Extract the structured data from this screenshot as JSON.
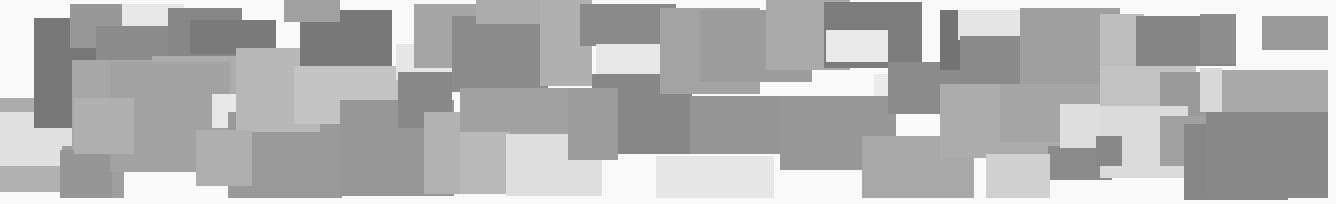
{
  "image": {
    "title": "Abstract grayscale rectangle mosaic",
    "description": "A horizontal band composed of many overlapping flat-gray rectangles of varying tone and size, forming a ragged collage against a white background.",
    "width": 1336,
    "height": 204,
    "background_color": "#ffffff",
    "style": "scanned halftone print texture",
    "palette": {
      "darkest": "#6f6f6f",
      "dark": "#7c7c7c",
      "mid_dark": "#8d8d8d",
      "mid": "#9a9a9a",
      "mid_light": "#a8a8a8",
      "light": "#b8b8b8",
      "lighter": "#c9c9c9",
      "pale": "#dcdcdc",
      "palest": "#eaeaea",
      "near_white": "#f2f2f2"
    },
    "tile_count": 52,
    "tiles": [
      {
        "name": "tile-01",
        "x": 0,
        "y": 98,
        "w": 96,
        "h": 30,
        "color": "#b0b0b0"
      },
      {
        "name": "tile-02",
        "x": 0,
        "y": 112,
        "w": 120,
        "h": 60,
        "color": "#e6e6e6"
      },
      {
        "name": "tile-03",
        "x": 0,
        "y": 166,
        "w": 120,
        "h": 26,
        "color": "#b5b5b5"
      },
      {
        "name": "tile-04",
        "x": 62,
        "y": 146,
        "w": 62,
        "h": 52,
        "color": "#a2a2a2"
      },
      {
        "name": "tile-05",
        "x": 34,
        "y": 18,
        "w": 66,
        "h": 110,
        "color": "#7a7a7a"
      },
      {
        "name": "tile-06",
        "x": 70,
        "y": 4,
        "w": 58,
        "h": 44,
        "color": "#9b9b9b"
      },
      {
        "name": "tile-07",
        "x": 122,
        "y": 4,
        "w": 62,
        "h": 36,
        "color": "#eeeeee"
      },
      {
        "name": "tile-08",
        "x": 96,
        "y": 26,
        "w": 84,
        "h": 48,
        "color": "#8f8f8f"
      },
      {
        "name": "tile-09",
        "x": 72,
        "y": 60,
        "w": 96,
        "h": 96,
        "color": "#ababab"
      },
      {
        "name": "tile-10",
        "x": 60,
        "y": 150,
        "w": 52,
        "h": 48,
        "color": "#999999"
      },
      {
        "name": "tile-11",
        "x": 168,
        "y": 8,
        "w": 74,
        "h": 58,
        "color": "#8a8a8a"
      },
      {
        "name": "tile-12",
        "x": 152,
        "y": 56,
        "w": 84,
        "h": 74,
        "color": "#b0b0b0"
      },
      {
        "name": "tile-13",
        "x": 110,
        "y": 62,
        "w": 120,
        "h": 110,
        "color": "#a6a6a6"
      },
      {
        "name": "tile-14",
        "x": 74,
        "y": 98,
        "w": 60,
        "h": 56,
        "color": "#b4b4b4"
      },
      {
        "name": "tile-15",
        "x": 212,
        "y": 94,
        "w": 62,
        "h": 34,
        "color": "#ededed"
      },
      {
        "name": "tile-16",
        "x": 228,
        "y": 112,
        "w": 114,
        "h": 86,
        "color": "#9d9d9d"
      },
      {
        "name": "tile-17",
        "x": 190,
        "y": 20,
        "w": 86,
        "h": 34,
        "color": "#7d7d7d"
      },
      {
        "name": "tile-18",
        "x": 236,
        "y": 48,
        "w": 84,
        "h": 84,
        "color": "#bcbcbc"
      },
      {
        "name": "tile-19",
        "x": 196,
        "y": 130,
        "w": 56,
        "h": 56,
        "color": "#b3b3b3"
      },
      {
        "name": "tile-20",
        "x": 300,
        "y": 10,
        "w": 92,
        "h": 62,
        "color": "#7b7b7b"
      },
      {
        "name": "tile-21",
        "x": 284,
        "y": 0,
        "w": 56,
        "h": 22,
        "color": "#a4a4a4"
      },
      {
        "name": "tile-22",
        "x": 294,
        "y": 66,
        "w": 110,
        "h": 58,
        "color": "#c8c8c8"
      },
      {
        "name": "tile-23",
        "x": 340,
        "y": 100,
        "w": 114,
        "h": 96,
        "color": "#9a9a9a"
      },
      {
        "name": "tile-24",
        "x": 396,
        "y": 44,
        "w": 62,
        "h": 36,
        "color": "#ececec"
      },
      {
        "name": "tile-25",
        "x": 414,
        "y": 4,
        "w": 94,
        "h": 64,
        "color": "#a9a9a9"
      },
      {
        "name": "tile-26",
        "x": 398,
        "y": 72,
        "w": 54,
        "h": 56,
        "color": "#8c8c8c"
      },
      {
        "name": "tile-27",
        "x": 424,
        "y": 112,
        "w": 62,
        "h": 82,
        "color": "#b6b6b6"
      },
      {
        "name": "tile-28",
        "x": 452,
        "y": 16,
        "w": 96,
        "h": 76,
        "color": "#8f8f8f"
      },
      {
        "name": "tile-29",
        "x": 476,
        "y": 0,
        "w": 82,
        "h": 24,
        "color": "#b0b0b0"
      },
      {
        "name": "tile-30",
        "x": 460,
        "y": 88,
        "w": 122,
        "h": 50,
        "color": "#a5a5a5"
      },
      {
        "name": "tile-31",
        "x": 460,
        "y": 132,
        "w": 50,
        "h": 62,
        "color": "#bdbdbd"
      },
      {
        "name": "tile-32",
        "x": 506,
        "y": 134,
        "w": 96,
        "h": 62,
        "color": "#e4e4e4"
      },
      {
        "name": "tile-33",
        "x": 540,
        "y": 0,
        "w": 52,
        "h": 86,
        "color": "#b4b4b4"
      },
      {
        "name": "tile-34",
        "x": 580,
        "y": 4,
        "w": 96,
        "h": 42,
        "color": "#8d8d8d"
      },
      {
        "name": "tile-35",
        "x": 596,
        "y": 44,
        "w": 66,
        "h": 38,
        "color": "#ededed"
      },
      {
        "name": "tile-36",
        "x": 592,
        "y": 74,
        "w": 100,
        "h": 80,
        "color": "#8a8a8a"
      },
      {
        "name": "tile-37",
        "x": 568,
        "y": 88,
        "w": 50,
        "h": 72,
        "color": "#a0a0a0"
      },
      {
        "name": "tile-38",
        "x": 660,
        "y": 8,
        "w": 100,
        "h": 86,
        "color": "#a7a7a7"
      },
      {
        "name": "tile-39",
        "x": 700,
        "y": 10,
        "w": 112,
        "h": 72,
        "color": "#a0a0a0"
      },
      {
        "name": "tile-40",
        "x": 656,
        "y": 156,
        "w": 118,
        "h": 42,
        "color": "#ececec"
      },
      {
        "name": "tile-41",
        "x": 690,
        "y": 96,
        "w": 112,
        "h": 58,
        "color": "#999999"
      },
      {
        "name": "tile-42",
        "x": 766,
        "y": 0,
        "w": 84,
        "h": 70,
        "color": "#aeaeae"
      },
      {
        "name": "tile-43",
        "x": 824,
        "y": 2,
        "w": 98,
        "h": 66,
        "color": "#7f7f7f"
      },
      {
        "name": "tile-44",
        "x": 826,
        "y": 30,
        "w": 62,
        "h": 32,
        "color": "#efefef"
      },
      {
        "name": "tile-45",
        "x": 874,
        "y": 74,
        "w": 34,
        "h": 34,
        "color": "#f1f1f1"
      },
      {
        "name": "tile-46",
        "x": 780,
        "y": 96,
        "w": 116,
        "h": 74,
        "color": "#9b9b9b"
      },
      {
        "name": "tile-47",
        "x": 888,
        "y": 62,
        "w": 74,
        "h": 52,
        "color": "#8e8e8e"
      },
      {
        "name": "tile-48",
        "x": 862,
        "y": 136,
        "w": 112,
        "h": 62,
        "color": "#acacac"
      },
      {
        "name": "tile-49",
        "x": 940,
        "y": 10,
        "w": 26,
        "h": 60,
        "color": "#767676"
      },
      {
        "name": "tile-50",
        "x": 958,
        "y": 10,
        "w": 64,
        "h": 30,
        "color": "#ebebeb"
      },
      {
        "name": "tile-51",
        "x": 960,
        "y": 36,
        "w": 64,
        "h": 48,
        "color": "#8d8d8d"
      },
      {
        "name": "tile-52",
        "x": 1020,
        "y": 8,
        "w": 100,
        "h": 82,
        "color": "#a3a3a3"
      },
      {
        "name": "tile-53",
        "x": 940,
        "y": 84,
        "w": 120,
        "h": 74,
        "color": "#b0b0b0"
      },
      {
        "name": "tile-54",
        "x": 1000,
        "y": 84,
        "w": 116,
        "h": 58,
        "color": "#a9a9a9"
      },
      {
        "name": "tile-55",
        "x": 1048,
        "y": 146,
        "w": 64,
        "h": 34,
        "color": "#8e8e8e"
      },
      {
        "name": "tile-56",
        "x": 986,
        "y": 154,
        "w": 64,
        "h": 44,
        "color": "#d5d5d5"
      },
      {
        "name": "tile-57",
        "x": 1060,
        "y": 104,
        "w": 60,
        "h": 44,
        "color": "#e4e4e4"
      },
      {
        "name": "tile-58",
        "x": 1100,
        "y": 14,
        "w": 44,
        "h": 52,
        "color": "#c2c2c2"
      },
      {
        "name": "tile-59",
        "x": 1136,
        "y": 16,
        "w": 100,
        "h": 50,
        "color": "#888888"
      },
      {
        "name": "tile-60",
        "x": 1100,
        "y": 66,
        "w": 96,
        "h": 42,
        "color": "#c7c7c7"
      },
      {
        "name": "tile-61",
        "x": 1160,
        "y": 72,
        "w": 62,
        "h": 56,
        "color": "#9e9e9e"
      },
      {
        "name": "tile-62",
        "x": 1100,
        "y": 106,
        "w": 88,
        "h": 72,
        "color": "#e0e0e0"
      },
      {
        "name": "tile-63",
        "x": 1160,
        "y": 116,
        "w": 52,
        "h": 50,
        "color": "#a4a4a4"
      },
      {
        "name": "tile-64",
        "x": 1096,
        "y": 136,
        "w": 26,
        "h": 30,
        "color": "#8b8b8b"
      },
      {
        "name": "tile-65",
        "x": 1184,
        "y": 124,
        "w": 104,
        "h": 76,
        "color": "#898989"
      },
      {
        "name": "tile-66",
        "x": 1200,
        "y": 14,
        "w": 36,
        "h": 50,
        "color": "#919191"
      },
      {
        "name": "tile-67",
        "x": 1262,
        "y": 16,
        "w": 66,
        "h": 34,
        "color": "#9d9d9d"
      },
      {
        "name": "tile-68",
        "x": 1218,
        "y": 70,
        "w": 110,
        "h": 56,
        "color": "#adadad"
      },
      {
        "name": "tile-69",
        "x": 1200,
        "y": 68,
        "w": 22,
        "h": 44,
        "color": "#dedede"
      },
      {
        "name": "tile-70",
        "x": 1206,
        "y": 112,
        "w": 122,
        "h": 86,
        "color": "#8c8c8c"
      }
    ]
  }
}
